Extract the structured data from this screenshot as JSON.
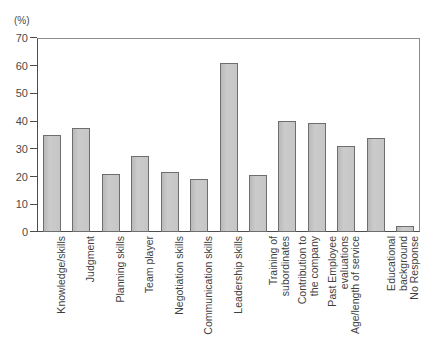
{
  "chart_data": {
    "type": "bar",
    "title": "",
    "subtitle": "",
    "xlabel": "",
    "ylabel": "(%)",
    "ylim": [
      0,
      70
    ],
    "ytick_values": [
      0,
      10,
      20,
      30,
      40,
      50,
      60,
      70
    ],
    "ytick_labels": [
      "0",
      "10",
      "20",
      "30",
      "40",
      "50",
      "60",
      "70"
    ],
    "grid": false,
    "legend": "none",
    "bar_color": "#c4c4c4",
    "bar_edge_color": "#6e6e6e",
    "categories": [
      "Knowledge/skills",
      "Judgment",
      "Planning skills",
      "Team player",
      "Negotiation skills",
      "Communication skills",
      "Leadership skills",
      "Training of subordinates",
      "Contribution to the company",
      "Past Employee evaluations",
      "Age/length of service",
      "Educational background",
      "No Response"
    ],
    "category_lines": [
      [
        "Knowledge/skills"
      ],
      [
        "Judgment"
      ],
      [
        "Planning skills"
      ],
      [
        "Team player"
      ],
      [
        "Negotiation skills"
      ],
      [
        "Communication skills"
      ],
      [
        "Leadership skills"
      ],
      [
        "Training of",
        "subordinates"
      ],
      [
        "Contribution to",
        "the company"
      ],
      [
        "Past Employee",
        "evaluations"
      ],
      [
        "Age/length of service"
      ],
      [
        "Educational",
        "background"
      ],
      [
        "No Response"
      ]
    ],
    "values": [
      35,
      37.5,
      21,
      27.5,
      21.5,
      19,
      61,
      20.5,
      40,
      39.5,
      31,
      34,
      2
    ]
  }
}
